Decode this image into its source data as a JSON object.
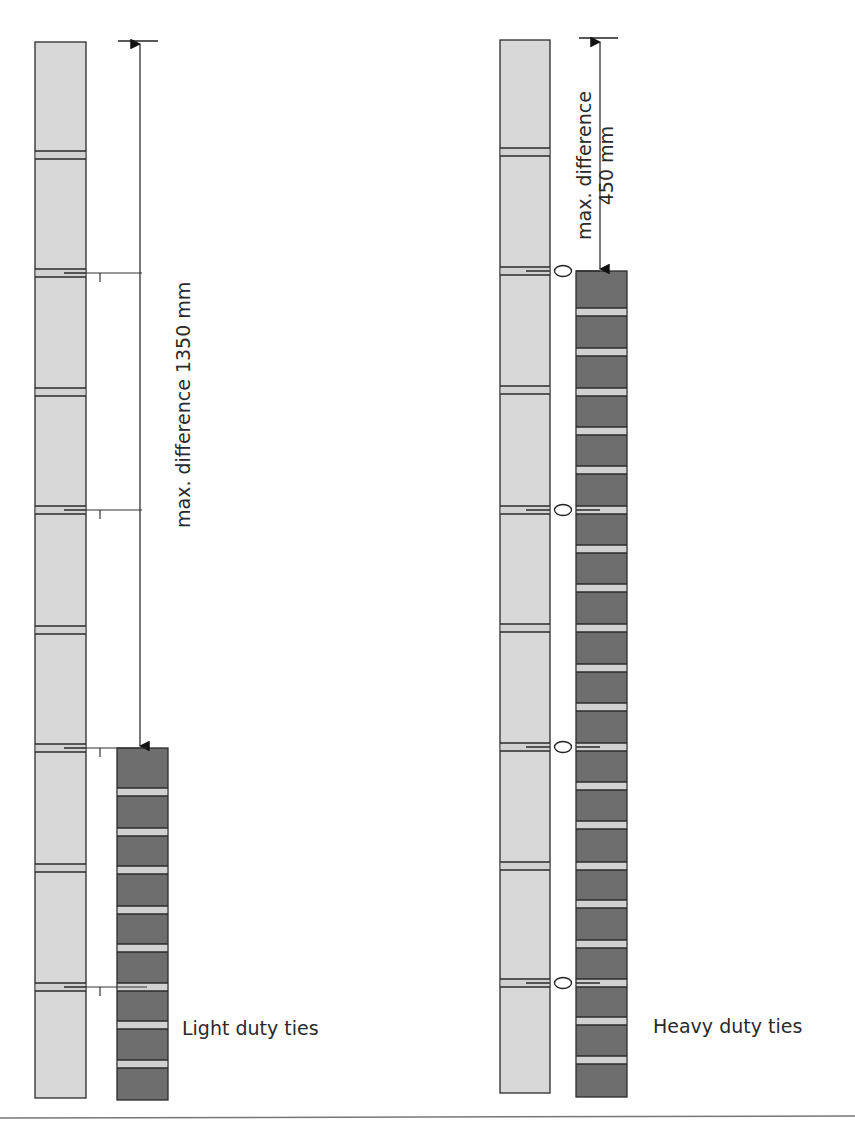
{
  "figure": {
    "panels": [
      {
        "id": "light",
        "caption": "Light duty ties",
        "dimension_label": "max. difference 1350 mm",
        "dimension_lines": [
          "max. difference 1350 mm"
        ],
        "tie_type": "light-duty",
        "inner_leaf": {
          "x": 35,
          "w": 51,
          "top": 42,
          "bottom": 1098,
          "joints": [
            155,
            273,
            392,
            510,
            630,
            748,
            868,
            987
          ]
        },
        "outer_leaf": {
          "x": 117,
          "w": 51,
          "top": 748,
          "bottom": 1100,
          "joints": [
            792,
            832,
            870,
            910,
            948,
            987,
            1025,
            1064
          ]
        },
        "ties_y": [
          273,
          510,
          748,
          987
        ],
        "arrow": {
          "x": 140,
          "top": 42,
          "bottom": 748,
          "cap_x1": 118,
          "cap_x2": 158,
          "cap_y": 41
        }
      },
      {
        "id": "heavy",
        "caption": "Heavy duty ties",
        "dimension_label": "max. difference 450 mm",
        "dimension_lines": [
          "max. difference",
          "450 mm"
        ],
        "tie_type": "heavy-duty",
        "inner_leaf": {
          "x": 500,
          "w": 50,
          "top": 40,
          "bottom": 1093,
          "joints": [
            152,
            271,
            390,
            510,
            628,
            747,
            866,
            983
          ]
        },
        "outer_leaf": {
          "x": 576,
          "w": 51,
          "top": 271,
          "bottom": 1097,
          "joints": [
            312,
            352,
            392,
            431,
            470,
            510,
            549,
            588,
            628,
            668,
            707,
            747,
            786,
            825,
            866,
            904,
            944,
            983,
            1021,
            1060
          ]
        },
        "ties_y": [
          271,
          510,
          747,
          983
        ],
        "arrow": {
          "x": 600,
          "top": 40,
          "bottom": 271,
          "cap_x1": 579,
          "cap_x2": 618,
          "cap_y": 38
        }
      }
    ],
    "colors": {
      "inner_leaf": "#d8d8d8",
      "outer_leaf": "#6e6e6e",
      "joint_fill": "#d2d2d2",
      "outline": "#2b2b2b",
      "text": "#2a2a2a",
      "rule": "#777777"
    }
  }
}
